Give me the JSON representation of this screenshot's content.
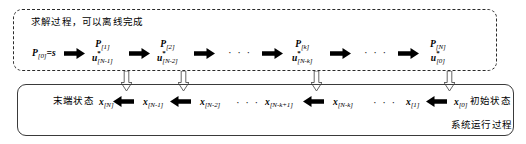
{
  "solve_panel": {
    "caption": "求解过程，可以离线完成",
    "terms": [
      {
        "p": "P",
        "p_sub": "[0]",
        "eq": "=s",
        "u": null,
        "u_sub": null
      },
      {
        "p": "P",
        "p_sub": "[1]",
        "eq": "",
        "u": "u",
        "u_sub": "[N-1]"
      },
      {
        "p": "P",
        "p_sub": "[2]",
        "eq": "",
        "u": "u",
        "u_sub": "[N-2]"
      },
      {
        "p": "P",
        "p_sub": "[k]",
        "eq": "",
        "u": "u",
        "u_sub": "[N-k]"
      },
      {
        "p": "P",
        "p_sub": "[N]",
        "eq": "",
        "u": "u",
        "u_sub": "[0]"
      }
    ],
    "ellipsis": "· · ·",
    "arrow_direction": "right",
    "arrow_color": "#000000"
  },
  "runtime_panel": {
    "caption": "系统运行过程",
    "terminal_state_label": "末端状态",
    "initial_state_label": "初始状态",
    "terms": [
      {
        "x": "x",
        "x_sub": "[N]"
      },
      {
        "x": "x",
        "x_sub": "[N-1]"
      },
      {
        "x": "x",
        "x_sub": "[N-2]"
      },
      {
        "x": "x",
        "x_sub": "[N-k+1]"
      },
      {
        "x": "x",
        "x_sub": "[N-k]"
      },
      {
        "x": "x",
        "x_sub": "[1]"
      },
      {
        "x": "x",
        "x_sub": "[0]"
      }
    ],
    "ellipsis": "· · ·",
    "arrow_direction": "left",
    "arrow_color": "#000000"
  },
  "connectors": {
    "count": 4,
    "direction": "down",
    "style": "hollow-outline",
    "stroke_color": "#555555"
  },
  "colors": {
    "background": "#ffffff",
    "text": "#000000",
    "dashed_border": "#2b2b2b",
    "solid_border": "#3a3a3a"
  }
}
